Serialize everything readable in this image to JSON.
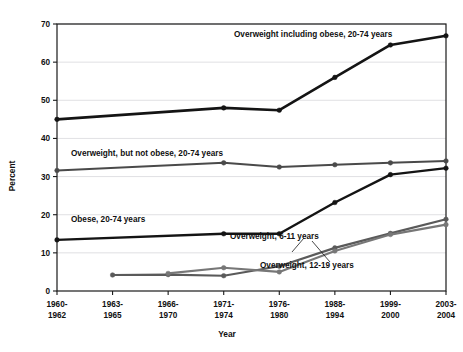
{
  "chart_data": {
    "type": "line",
    "title": "",
    "xlabel": "Year",
    "ylabel": "Percent",
    "ylim": [
      0,
      70
    ],
    "yticks": [
      0,
      10,
      20,
      30,
      40,
      50,
      60,
      70
    ],
    "grid": true,
    "legend_position": "inline-annotations",
    "categories": [
      "1960-\n1962",
      "1963-\n1965",
      "1966-\n1970",
      "1971-\n1974",
      "1976-\n1980",
      "1988-\n1994",
      "1999-\n2000",
      "2003-\n2004"
    ],
    "category_lines": [
      [
        "1960-",
        "1962"
      ],
      [
        "1963-",
        "1965"
      ],
      [
        "1966-",
        "1970"
      ],
      [
        "1971-",
        "1974"
      ],
      [
        "1976-",
        "1980"
      ],
      [
        "1988-",
        "1994"
      ],
      [
        "1999-",
        "2000"
      ],
      [
        "2003-",
        "2004"
      ]
    ],
    "series": [
      {
        "name": "Overweight including obese, 20-74 years",
        "color": "#141414",
        "width": 2.6,
        "values": [
          45.0,
          null,
          null,
          48.0,
          47.4,
          56.0,
          64.5,
          66.9
        ]
      },
      {
        "name": "Overweight, but not obese, 20-74 years",
        "color": "#4a4a4a",
        "width": 2.0,
        "values": [
          31.6,
          null,
          null,
          33.6,
          32.5,
          33.1,
          33.6,
          34.1
        ]
      },
      {
        "name": "Obese, 20-74 years",
        "color": "#141414",
        "width": 2.4,
        "values": [
          13.4,
          null,
          null,
          15.0,
          15.0,
          23.2,
          30.5,
          32.2
        ]
      },
      {
        "name": "Overweight, 6-11 years",
        "color": "#5a5a5a",
        "width": 2.2,
        "values": [
          null,
          4.2,
          4.3,
          4.0,
          6.5,
          11.3,
          15.1,
          18.8
        ]
      },
      {
        "name": "Overweight, 12-19 years",
        "color": "#777777",
        "width": 2.2,
        "values": [
          null,
          null,
          4.6,
          6.1,
          5.0,
          10.5,
          14.8,
          17.4
        ]
      }
    ],
    "annotations": [
      {
        "text": "Overweight including obese, 20-74 years",
        "x": 234,
        "y": 37,
        "anchor": "start"
      },
      {
        "text": "Overweight, but not obese, 20-74 years",
        "x": 71,
        "y": 156,
        "anchor": "start"
      },
      {
        "text": "Obese, 20-74 years",
        "x": 71,
        "y": 222,
        "anchor": "start"
      },
      {
        "text": "Overweight, 6-11 years",
        "x": 230,
        "y": 239,
        "anchor": "start"
      },
      {
        "text": "Overweight, 12-19 years",
        "x": 260,
        "y": 268,
        "anchor": "start"
      }
    ]
  },
  "axis": {
    "y_title": "Percent",
    "x_title": "Year",
    "y_tick_labels": [
      "0",
      "10",
      "20",
      "30",
      "40",
      "50",
      "60",
      "70"
    ]
  }
}
